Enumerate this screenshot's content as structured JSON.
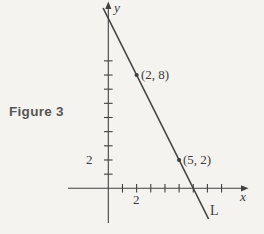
{
  "figure": {
    "caption": "Figure 3",
    "line_label": "L",
    "colors": {
      "background": "#f5f3f0",
      "ink": "#404040",
      "caption_text": "#565656"
    }
  },
  "chart_data": {
    "type": "line",
    "title": "Figure 3",
    "xlabel": "x",
    "ylabel": "y",
    "grid": false,
    "x_ticks": [
      1,
      2,
      3,
      4,
      5,
      6,
      7,
      8
    ],
    "y_ticks": [
      1,
      2,
      3,
      4,
      5,
      6,
      7,
      8,
      9
    ],
    "x_tick_label": {
      "value": 2,
      "label": "2"
    },
    "y_tick_label": {
      "value": 2,
      "label": "2"
    },
    "xlim": [
      -2.8,
      9.9
    ],
    "ylim": [
      -3.2,
      13.2
    ],
    "series": [
      {
        "name": "L",
        "x_intercept": 6,
        "y_intercept": 12,
        "marked_points": [
          {
            "x": 2,
            "y": 8,
            "label": "(2, 8)"
          },
          {
            "x": 5,
            "y": 2,
            "label": "(5, 2)"
          }
        ]
      }
    ]
  }
}
